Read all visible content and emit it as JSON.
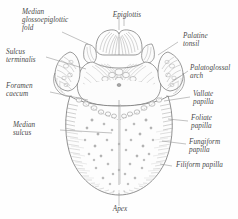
{
  "figure": {
    "background_color": "#fefefe",
    "ink_color": "#6b6b6b",
    "label_color": "#4a4a4a"
  },
  "labels": {
    "median_glossoepiglottic_fold": "Median\nglossoepiglottic\nfold",
    "sulcus_terminalis": "Sulcus\nterminalis",
    "foramen_caecum": "Foramen\ncaecum",
    "median_sulcus": "Median\nsulcus",
    "epiglottis": "Epiglottis",
    "palatine_tonsil": "Palatine\ntonsil",
    "palatoglossal_arch": "Palatoglossal\narch",
    "vallate_papilla": "Vallate\npapilla",
    "foliate_papilla": "Foliate\npapilla",
    "fungiform_papilla": "Fungiform\npapilla",
    "filiform_papilla": "Filiform papilla",
    "apex": "Apex"
  }
}
